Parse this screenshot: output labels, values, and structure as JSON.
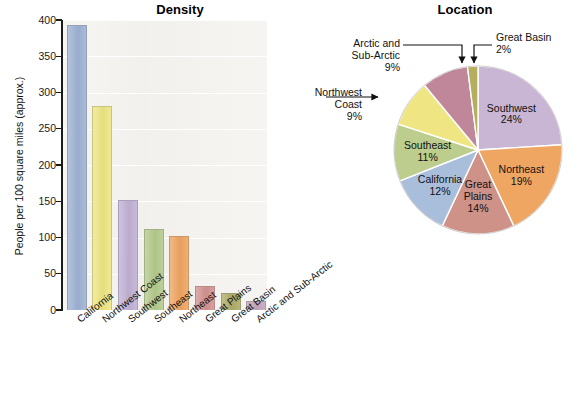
{
  "chart_data": [
    {
      "type": "bar",
      "title": "Density",
      "xlabel": "",
      "ylabel": "People per 100 square miles (approx.)",
      "ylim": [
        0,
        400
      ],
      "yticks": [
        0,
        50,
        100,
        150,
        200,
        250,
        300,
        350,
        400
      ],
      "grid": true,
      "legend": "none",
      "categories": [
        "California",
        "Northwest Coast",
        "Southwest",
        "Southeast",
        "Northeast",
        "Great Plains",
        "Great Basin",
        "Arctic and Sub-Arctic"
      ],
      "values": [
        393,
        282,
        152,
        112,
        102,
        33,
        23,
        13
      ],
      "colors": [
        "#9FB3D4",
        "#EFE683",
        "#C2B2D6",
        "#B5CB8D",
        "#EFA662",
        "#D39491",
        "#AFAE6A",
        "#C4A8BE"
      ]
    },
    {
      "type": "pie",
      "title": "Location",
      "labels": [
        "Southwest",
        "Northeast",
        "Great Plains",
        "California",
        "Southeast",
        "Northwest Coast",
        "Arctic and Sub-Arctic",
        "Great Basin"
      ],
      "values": [
        24,
        19,
        14,
        12,
        11,
        9,
        9,
        2
      ],
      "value_labels": [
        "24%",
        "19%",
        "14%",
        "12%",
        "11%",
        "9%",
        "9%",
        "2%"
      ],
      "colors": [
        "#C8B6D4",
        "#EFA662",
        "#CE9288",
        "#A9BEDB",
        "#BCCD8D",
        "#EFE683",
        "#C0879A",
        "#B4AE5E"
      ],
      "start_angle_deg": -90,
      "direction": "clockwise"
    }
  ],
  "bar_chart": {
    "title": "Density",
    "y_axis_title": "People per 100 square miles (approx.)",
    "y_ticks": [
      "400",
      "350",
      "300",
      "250",
      "200",
      "150",
      "100",
      "50",
      "0"
    ],
    "categories": [
      {
        "label": "California",
        "value": 393
      },
      {
        "label": "Northwest Coast",
        "value": 282
      },
      {
        "label": "Southwest",
        "value": 152
      },
      {
        "label": "Southeast",
        "value": 112
      },
      {
        "label": "Northeast",
        "value": 102
      },
      {
        "label": "Great Plains",
        "value": 33
      },
      {
        "label": "Great Basin",
        "value": 23
      },
      {
        "label": "Arctic and Sub-Arctic",
        "value": 13
      }
    ]
  },
  "pie_chart": {
    "title": "Location",
    "inside_labels": [
      {
        "name": "Southwest",
        "pct": "24%"
      },
      {
        "name": "Northeast",
        "pct": "19%"
      },
      {
        "name": "Great Plains",
        "pct": "14%",
        "name2": "Great",
        "name3": "Plains"
      },
      {
        "name": "California",
        "pct": "12%"
      },
      {
        "name": "Southeast",
        "pct": "11%"
      }
    ],
    "callouts": [
      {
        "line1": "Great Basin",
        "line2": "2%"
      },
      {
        "line1": "Arctic and",
        "line2": "Sub-Arctic",
        "line3": "9%"
      },
      {
        "line1": "Northwest",
        "line2": "Coast",
        "line3": "9%"
      }
    ]
  }
}
